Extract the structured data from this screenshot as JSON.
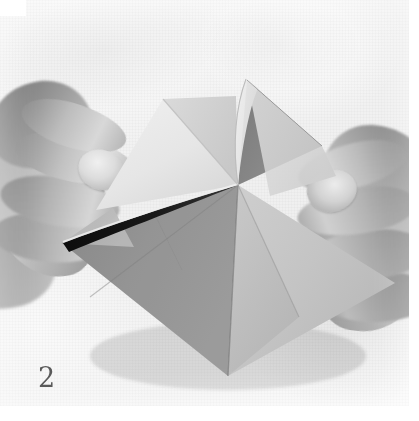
{
  "figure": {
    "kind": "instructional-photograph",
    "color_mode": "grayscale",
    "step_number": "2",
    "caption_position": "bottom-left"
  },
  "colors": {
    "background_cloth": "#f2f2f2",
    "paper_light": "#e8e8e8",
    "paper_mid": "#c5c5c5",
    "paper_gray": "#9a9a9a",
    "paper_shadow": "#8a8a8a",
    "paper_dark": "#787878",
    "fold_shadow": "#151515",
    "skin_mid": "#b0b0b0",
    "skin_dark": "#7c7c7c",
    "number_ink": "#4a4a4a",
    "plate_margin": "#ffffff"
  },
  "scene": {
    "hands": [
      {
        "id": "hand-left",
        "label": "Left hand gripping the near-left edge of the paper",
        "position": "left"
      },
      {
        "id": "hand-right",
        "label": "Right hand gripping the near-right edge of the paper",
        "position": "right"
      }
    ],
    "paper": {
      "label": "Folded paper model",
      "center_vertex": "238,185",
      "facets": [
        {
          "id": "facet-upper-left-flap",
          "label": "Upper-left raised flap",
          "tone": "paper_light"
        },
        {
          "id": "facet-upper-left-inner",
          "label": "Upper-left inner face",
          "tone": "paper_mid"
        },
        {
          "id": "facet-upper-right-curl",
          "label": "Upper-right curled flap edge",
          "tone": "paper_light"
        },
        {
          "id": "facet-upper-right-shaded",
          "label": "Upper-right shaded inner face",
          "tone": "paper_shadow"
        },
        {
          "id": "facet-lower-left",
          "label": "Lower-left diamond facet",
          "tone": "paper_gray"
        },
        {
          "id": "facet-lower-center",
          "label": "Lower-center diamond facet",
          "tone": "paper_gray"
        },
        {
          "id": "facet-lower-right",
          "label": "Lower-right diamond facet",
          "tone": "paper_mid"
        },
        {
          "id": "facet-left-tip",
          "label": "Far-left pointed corner",
          "tone": "paper_mid"
        }
      ],
      "creases": [
        {
          "id": "crease-vertical-center",
          "label": "Vertical centre crease"
        },
        {
          "id": "crease-left-diagonal",
          "label": "Left diagonal crease"
        },
        {
          "id": "crease-right-diagonal",
          "label": "Right diagonal crease"
        },
        {
          "id": "crease-open-gap",
          "label": "Dark open gap along the left upper edge"
        }
      ]
    }
  }
}
